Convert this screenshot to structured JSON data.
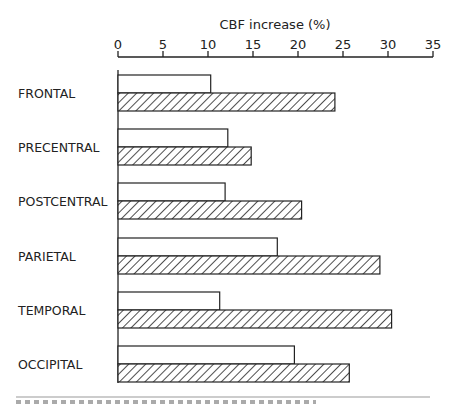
{
  "chart_data": {
    "type": "bar",
    "orientation": "horizontal",
    "title": "",
    "xlabel": "CBF increase (%)",
    "ylabel": "",
    "xlim": [
      0,
      35
    ],
    "xticks": [
      0,
      5,
      10,
      15,
      20,
      25,
      30,
      35
    ],
    "axis_position": "top",
    "grid": false,
    "legend": null,
    "categories": [
      "FRONTAL",
      "PRECENTRAL",
      "POSTCENTRAL",
      "PARIETAL",
      "TEMPORAL",
      "OCCIPITAL"
    ],
    "series": [
      {
        "name": "open",
        "style": "white-fill",
        "values": [
          10.3,
          12.2,
          11.9,
          17.7,
          11.3,
          19.6
        ]
      },
      {
        "name": "hatched",
        "style": "diagonal-hatch",
        "values": [
          24.1,
          14.8,
          20.4,
          29.1,
          30.4,
          25.7
        ]
      }
    ]
  },
  "labels": {
    "axis_title": "CBF increase (%)"
  }
}
